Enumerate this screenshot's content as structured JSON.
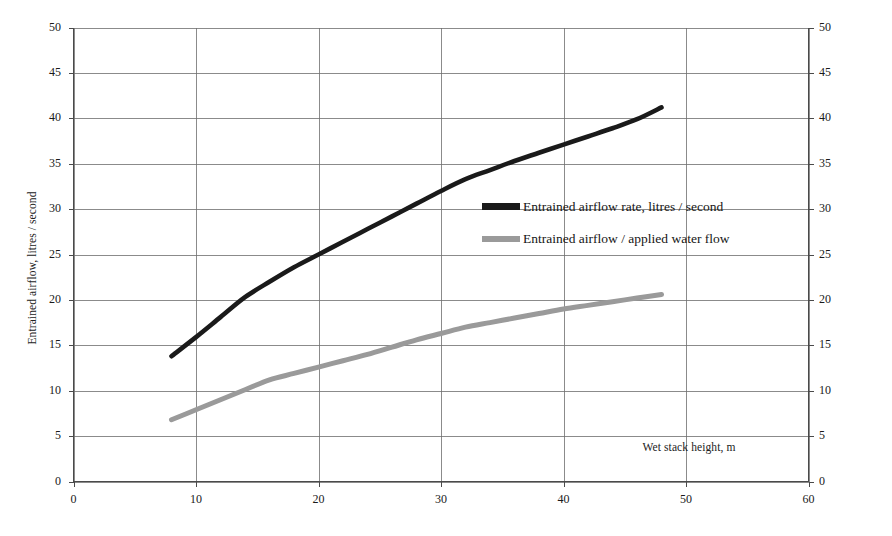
{
  "chart_data": {
    "type": "line",
    "title": "",
    "xlabel": "Wet stack height, m",
    "ylabel": "Entrained airflow, litres / second",
    "y2label": "Entrained airflow / applied water flow",
    "xlim": [
      0,
      60
    ],
    "ylim": [
      0,
      50
    ],
    "y2lim": [
      0,
      50
    ],
    "xticks": [
      0,
      10,
      20,
      30,
      40,
      50,
      60
    ],
    "yticks": [
      0,
      5,
      10,
      15,
      20,
      25,
      30,
      35,
      40,
      45,
      50
    ],
    "y2ticks": [
      0,
      5,
      10,
      15,
      20,
      25,
      30,
      35,
      40,
      45,
      50
    ],
    "grid": "horizontal-and-vertical",
    "legend_position": "center-right-inside",
    "series": [
      {
        "name": "Entrained airflow rate, litres / second",
        "color": "#1a1a1a",
        "axis": "left",
        "x": [
          8,
          10,
          12,
          14,
          16,
          18,
          20,
          22,
          24,
          26,
          28,
          30,
          32,
          34,
          36,
          38,
          40,
          42,
          44,
          46,
          48
        ],
        "values": [
          13.8,
          15.9,
          18.1,
          20.3,
          22.0,
          23.6,
          25.0,
          26.4,
          27.8,
          29.2,
          30.6,
          32.0,
          33.3,
          34.3,
          35.3,
          36.2,
          37.1,
          38.0,
          38.9,
          39.9,
          41.2
        ]
      },
      {
        "name": "Entrained airflow / applied water flow",
        "color": "#9a9a9a",
        "axis": "right",
        "x": [
          8,
          10,
          12,
          14,
          16,
          18,
          20,
          22,
          24,
          26,
          28,
          30,
          32,
          34,
          36,
          38,
          40,
          42,
          44,
          46,
          48
        ],
        "values": [
          6.8,
          7.9,
          9.0,
          10.1,
          11.2,
          11.9,
          12.6,
          13.3,
          14.0,
          14.8,
          15.6,
          16.3,
          17.0,
          17.5,
          18.0,
          18.5,
          19.0,
          19.4,
          19.8,
          20.2,
          20.6
        ]
      }
    ]
  },
  "axes": {
    "left_title": "Entrained airflow, litres / second",
    "right_title": "Entrained airflow / applied water flow",
    "x_title": "Wet stack height, m"
  },
  "legend": {
    "items": [
      {
        "label": "Entrained airflow rate, litres / second",
        "color": "#1a1a1a"
      },
      {
        "label": "Entrained airflow / applied water flow",
        "color": "#9a9a9a"
      }
    ]
  },
  "colors": {
    "series_black": "#1a1a1a",
    "series_gray": "#9a9a9a",
    "grid": "#6e6e6e",
    "axis": "#4a4a4a",
    "background": "#ffffff"
  }
}
